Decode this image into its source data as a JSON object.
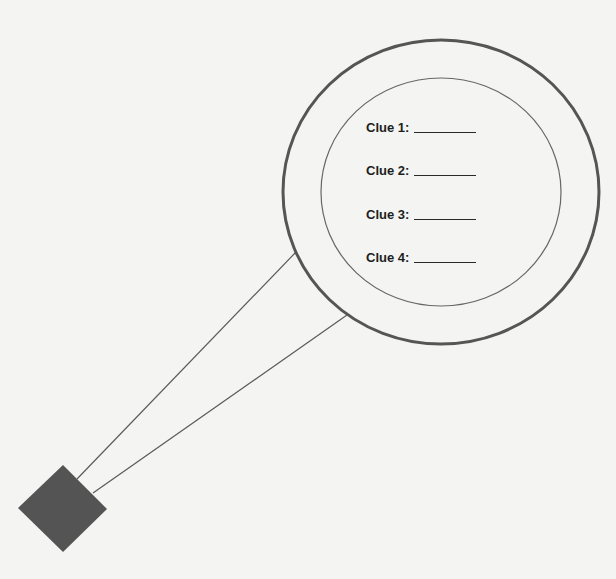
{
  "diagram": {
    "type": "magnifying-glass graphic organizer",
    "colors": {
      "background": "#f4f4f2",
      "outer_ring": "#555555",
      "inner_ring": "#666666",
      "handle_lines": "#555555",
      "handle_grip": "#555555",
      "text": "#1e1e1e"
    },
    "clues": [
      {
        "label": "Clue 1:",
        "answer": ""
      },
      {
        "label": "Clue 2:",
        "answer": ""
      },
      {
        "label": "Clue 3:",
        "answer": ""
      },
      {
        "label": "Clue 4:",
        "answer": ""
      }
    ]
  }
}
